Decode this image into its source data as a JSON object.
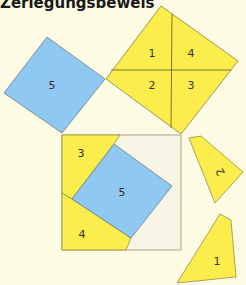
{
  "title": "Zerlegungsbeweis",
  "colors": {
    "background": "#fdfbe3",
    "yellow": "#fbee4c",
    "blue": "#8fc8f0",
    "frame_fill": "#f7f5e6",
    "stroke": "#8a8040"
  },
  "labels": {
    "top_square": [
      "1",
      "4",
      "2",
      "3"
    ],
    "left_square": "5",
    "frame_piece_3": "3",
    "frame_piece_5": "5",
    "frame_piece_4": "4",
    "loose_piece_2": "2",
    "loose_piece_1": "1"
  }
}
